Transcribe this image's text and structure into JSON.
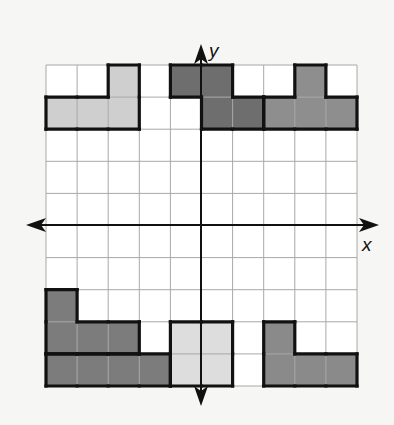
{
  "diagram": {
    "type": "coordinate-grid",
    "grid": {
      "columns": 10,
      "rows": 10,
      "x_range": [
        -5,
        5
      ],
      "y_range": [
        -5,
        5
      ],
      "origin_px": [
        201,
        225
      ],
      "left_px": 46,
      "top_px": 65,
      "cell_w": 31.1,
      "cell_h": 32.1,
      "line_color": "#a8a8a8",
      "cell_fill": "#ffffff"
    },
    "axes": {
      "x_label": "x",
      "y_label": "y",
      "color": "#111111"
    },
    "shapes": [
      {
        "name": "top-left-light-l-shape",
        "fill": "#cfcfcf",
        "cells": [
          [
            2,
            0
          ],
          [
            0,
            1
          ],
          [
            1,
            1
          ],
          [
            2,
            1
          ]
        ]
      },
      {
        "name": "top-center-dark-z-shape",
        "fill": "#6e6e6e",
        "cells": [
          [
            4,
            0
          ],
          [
            5,
            0
          ],
          [
            5,
            1
          ],
          [
            6,
            1
          ]
        ]
      },
      {
        "name": "top-right-medium-t-shape",
        "fill": "#8e8e8e",
        "cells": [
          [
            8,
            0
          ],
          [
            7,
            1
          ],
          [
            8,
            1
          ],
          [
            9,
            1
          ]
        ]
      },
      {
        "name": "bottom-left-dark-l-shape",
        "fill": "#7c7c7c",
        "cells": [
          [
            0,
            7
          ],
          [
            0,
            8
          ],
          [
            1,
            8
          ],
          [
            2,
            8
          ]
        ]
      },
      {
        "name": "bottom-left-dark-bar",
        "fill": "#7c7c7c",
        "cells": [
          [
            0,
            9
          ],
          [
            1,
            9
          ],
          [
            2,
            9
          ],
          [
            3,
            9
          ]
        ]
      },
      {
        "name": "bottom-center-light-square",
        "fill": "#dddddd",
        "cells": [
          [
            4,
            8
          ],
          [
            5,
            8
          ],
          [
            4,
            9
          ],
          [
            5,
            9
          ]
        ]
      },
      {
        "name": "bottom-right-medium-l-shape",
        "fill": "#8a8a8a",
        "cells": [
          [
            7,
            8
          ],
          [
            7,
            9
          ],
          [
            8,
            9
          ],
          [
            9,
            9
          ]
        ]
      }
    ]
  }
}
